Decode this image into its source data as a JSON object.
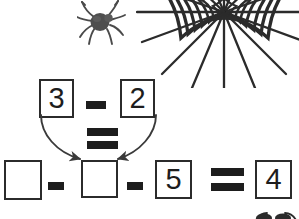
{
  "worksheet": {
    "title": "Halloween spider math puzzle",
    "background_color": "#ffffff",
    "ink_color": "#1d1d1d",
    "width": 299,
    "height": 219
  },
  "decorations": [
    {
      "name": "spider-icon",
      "label": "spider",
      "color": "#4a4a4a"
    },
    {
      "name": "spider-web-icon",
      "label": "spider web",
      "color": "#2b2b2b"
    },
    {
      "name": "spider-bottom-icon",
      "label": "spider partially cut off",
      "color": "#2b2b2b"
    }
  ],
  "top_equation": {
    "name": "top-equation",
    "text": "3 - 2 =",
    "operand_1": "3",
    "operator_1": "-",
    "operand_2": "2",
    "equals": "=",
    "result_target": "second blank box in bottom equation"
  },
  "bottom_equation": {
    "name": "bottom-equation",
    "text": "_ - _ - 5 = 4",
    "blank_1": "",
    "operator_1": "-",
    "blank_2": "",
    "operator_2": "-",
    "operand_3": "5",
    "equals": "=",
    "answer": "4"
  },
  "arrows": {
    "name": "answer-transfer-arrows",
    "label": "curved arrows from 3 and 2 into second blank",
    "count": 2,
    "color": "#3a3a3a"
  }
}
